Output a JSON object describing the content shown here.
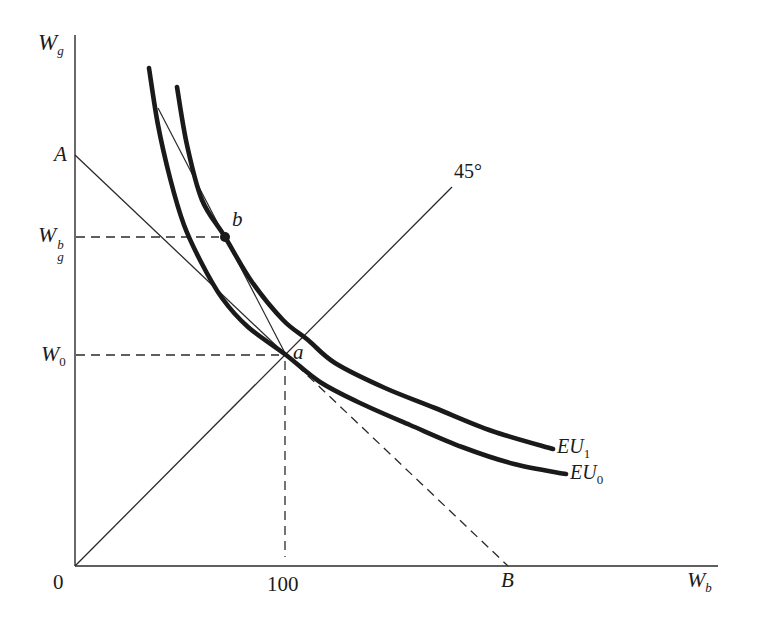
{
  "figure_title": "state-preference expected-utility indifference curve diagram",
  "colors": {
    "background": "#ffffff",
    "ink": "#1b1b1b",
    "curve_ink": "#1a1a1a"
  },
  "canvas": {
    "width": 757,
    "height": 634
  },
  "figure": {
    "lines": {
      "axis_y": {
        "x1": 75,
        "y1": 35,
        "x2": 75,
        "y2": 566
      },
      "axis_x": {
        "x1": 75,
        "y1": 566,
        "x2": 718,
        "y2": 566
      },
      "deg45_line": {
        "x1": 75,
        "y1": 566,
        "x2": 452,
        "y2": 187
      },
      "budget_solid": {
        "x1": 75,
        "y1": 155,
        "x2": 286,
        "y2": 355
      },
      "budget_dashed": {
        "x1": 286,
        "y1": 355,
        "x2": 508,
        "y2": 566
      },
      "chord_line": {
        "x1": 158,
        "y1": 108,
        "x2": 286,
        "y2": 355
      },
      "guide_wgb": {
        "x1": 76,
        "y1": 237,
        "x2": 219,
        "y2": 237
      },
      "guide_w0": {
        "x1": 76,
        "y1": 355,
        "x2": 279,
        "y2": 355
      },
      "guide_100": {
        "x1": 285,
        "y1": 361,
        "x2": 285,
        "y2": 557
      }
    },
    "curves": {
      "eu0": [
        [
          149,
          68
        ],
        [
          158,
          125
        ],
        [
          170,
          178
        ],
        [
          184,
          225
        ],
        [
          201,
          262
        ],
        [
          222,
          298
        ],
        [
          248,
          327
        ],
        [
          286,
          355
        ],
        [
          320,
          382
        ],
        [
          360,
          403
        ],
        [
          410,
          425
        ],
        [
          462,
          447
        ],
        [
          514,
          464
        ],
        [
          566,
          474
        ]
      ],
      "eu1": [
        [
          177,
          87
        ],
        [
          187,
          145
        ],
        [
          202,
          200
        ],
        [
          225,
          237
        ],
        [
          252,
          282
        ],
        [
          283,
          320
        ],
        [
          308,
          340
        ],
        [
          335,
          363
        ],
        [
          385,
          388
        ],
        [
          435,
          408
        ],
        [
          492,
          431
        ],
        [
          553,
          449
        ]
      ]
    },
    "points": {
      "point_b": {
        "x": 225,
        "y": 237,
        "r": 5
      }
    }
  },
  "labels": {
    "y_axis": {
      "base": "W",
      "sub": "g"
    },
    "intercept_a": "A",
    "wgb": {
      "base": "W",
      "sup": "b",
      "sub": "g"
    },
    "w0": {
      "base": "W",
      "sub": "0"
    },
    "origin": "0",
    "x100": "100",
    "intercept_b": "B",
    "x_axis": {
      "base": "W",
      "sub": "b"
    },
    "deg45": "45°",
    "point_a": "a",
    "point_b": "b",
    "eu1": {
      "base": "EU",
      "sub": "1"
    },
    "eu0": {
      "base": "EU",
      "sub": "0"
    }
  }
}
